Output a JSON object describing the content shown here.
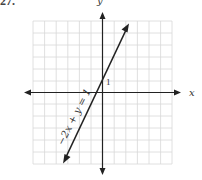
{
  "problem_number": "27.",
  "graph": {
    "x_axis_label": "x",
    "y_axis_label": "y",
    "tick_label": "1",
    "equation_label": "−2x + y = 1",
    "grid": {
      "columns": 12,
      "rows": 12,
      "x_range": [
        -6,
        6
      ],
      "y_range": [
        -6,
        6
      ]
    },
    "line": {
      "slope": 2,
      "intercept": 1
    },
    "colors": {
      "grid": "#d8d8d8",
      "axes": "#222222",
      "line": "#222222"
    }
  }
}
